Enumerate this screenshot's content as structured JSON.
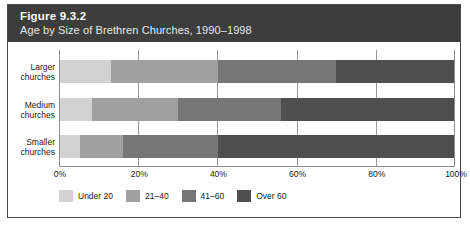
{
  "figure": {
    "number": "Figure 9.3.2",
    "subtitle": "Age by Size of Brethren Churches, 1990–1998",
    "header_bg": "#3d3d3d",
    "frame_border": "#4a4a4a"
  },
  "chart_data": {
    "type": "bar",
    "orientation": "horizontal",
    "stacked": true,
    "stack_mode": "percent",
    "title": "Figure 9.3.2",
    "subtitle": "Age by Size of Brethren Churches, 1990–1998",
    "xlabel": "",
    "ylabel": "",
    "xlim": [
      0,
      100
    ],
    "xticks": [
      0,
      20,
      40,
      60,
      80,
      100
    ],
    "xticklabels": [
      "0%",
      "20%",
      "40%",
      "60%",
      "80%",
      "100%"
    ],
    "grid": true,
    "legend_position": "bottom",
    "categories": [
      "Larger churches",
      "Medium churches",
      "Smaller churches"
    ],
    "category_lines": [
      [
        "Larger",
        "churches"
      ],
      [
        "Medium",
        "churches"
      ],
      [
        "Smaller",
        "churches"
      ]
    ],
    "series": [
      {
        "name": "Under 20",
        "color": "#d2d2d2",
        "values": [
          13,
          8,
          5
        ]
      },
      {
        "name": "21–40",
        "color": "#a0a0a0",
        "values": [
          27,
          22,
          11
        ]
      },
      {
        "name": "41–60",
        "color": "#767676",
        "values": [
          30,
          26,
          24
        ]
      },
      {
        "name": "Over 60",
        "color": "#4f4f4f",
        "values": [
          30,
          44,
          60
        ]
      }
    ]
  }
}
